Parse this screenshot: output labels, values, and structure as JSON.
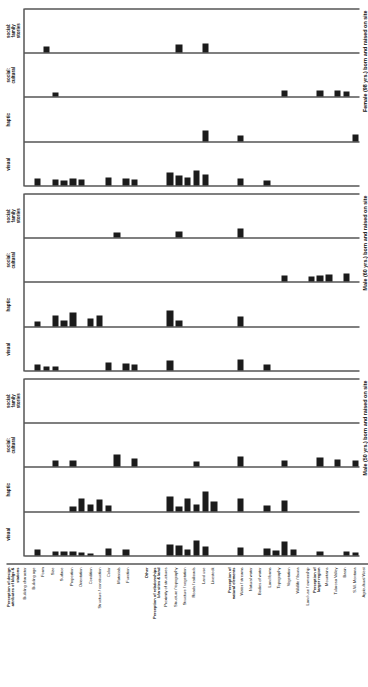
{
  "figure": {
    "orientation": "rotated-90",
    "ink_color": "#1b1b1b",
    "column_headers": [
      "visual",
      "haptic",
      "social:\ncultural",
      "social:\nfamily\nstories"
    ],
    "panel_captions": [
      "Male (50 yrs.) born and raised on site",
      "Male (60 yrs.) born and raised on site",
      "Female (98 yrs.) born and raised on site"
    ],
    "row_labels": [
      "Perception of design\nattributes of bldgs &\nstations",
      "Building character",
      "Building age",
      "Form",
      "Size",
      "Surface",
      "Proportion",
      "Orientation",
      "Condition",
      "Structure / construction",
      "Color",
      "Materials",
      "Function",
      "",
      "Other",
      "Perception of relationships\nb/w sites & land",
      "Proximity of structures",
      "Structure / topography",
      "Structure / vegetation",
      "Roads / railroads",
      "Land use",
      "Livestock",
      "",
      "Perception of\nnatural elements",
      "Water / streams",
      "Natural water",
      "Bodies of water",
      "Land forms",
      "Topography",
      "Vegetation",
      "Wildlife / fauna",
      "Land use / ownership",
      "Perception of\nlarger region",
      "Mountains",
      "Tularosa Valley",
      "Basin",
      "S.W. Montana",
      "Agricultural West"
    ]
  },
  "chart_data": {
    "type": "bar",
    "title": "",
    "xlabel": "",
    "ylabel": "",
    "orientation": "horizontal",
    "xlim": [
      0,
      100
    ],
    "grid": false,
    "legend": "none",
    "categories": [
      "Perception of design attributes of bldgs & stations",
      "Building character",
      "Building age",
      "Form",
      "Size",
      "Surface",
      "Proportion",
      "Orientation",
      "Condition",
      "Structure / construction",
      "Color",
      "Materials",
      "Function",
      "",
      "Other",
      "Perception of relationships b/w sites & land",
      "Proximity of structures",
      "Structure / topography",
      "Structure / vegetation",
      "Roads / railroads",
      "Land use",
      "Livestock",
      "",
      "Perception of natural elements",
      "Water / streams",
      "Natural water",
      "Bodies of water",
      "Land forms",
      "Topography",
      "Vegetation",
      "Wildlife / fauna",
      "Land use / ownership",
      "Perception of larger region",
      "Mountains",
      "Tularosa Valley",
      "Basin",
      "S.W. Montana",
      "Agricultural West"
    ],
    "panels": [
      {
        "name": "Male (50 yrs.) born and raised on site",
        "series": [
          {
            "name": "visual",
            "values": [
              0,
              14,
              0,
              9,
              10,
              9,
              8,
              5,
              0,
              16,
              0,
              13,
              0,
              0,
              0,
              0,
              26,
              22,
              14,
              34,
              20,
              0,
              0,
              0,
              18,
              0,
              0,
              16,
              12,
              32,
              14,
              0,
              0,
              9,
              0,
              0,
              9,
              8
            ]
          },
          {
            "name": "haptic",
            "values": [
              0,
              0,
              0,
              0,
              0,
              12,
              30,
              16,
              28,
              14,
              0,
              0,
              0,
              0,
              0,
              0,
              34,
              12,
              30,
              16,
              46,
              22,
              0,
              0,
              30,
              0,
              0,
              14,
              0,
              26,
              0,
              0,
              0,
              0,
              0,
              0,
              0,
              0
            ]
          },
          {
            "name": "social: cultural",
            "values": [
              0,
              0,
              0,
              16,
              0,
              16,
              0,
              0,
              0,
              0,
              30,
              0,
              20,
              0,
              0,
              0,
              0,
              0,
              0,
              12,
              0,
              0,
              0,
              0,
              24,
              0,
              0,
              0,
              0,
              14,
              0,
              0,
              0,
              22,
              0,
              18,
              0,
              16
            ]
          },
          {
            "name": "social: family stories",
            "values": [
              0,
              0,
              0,
              0,
              0,
              0,
              0,
              0,
              0,
              0,
              0,
              0,
              0,
              0,
              0,
              0,
              0,
              0,
              0,
              0,
              0,
              0,
              0,
              0,
              0,
              0,
              0,
              0,
              0,
              0,
              0,
              0,
              0,
              0,
              0,
              0,
              0,
              0
            ]
          }
        ]
      },
      {
        "name": "Male (60 yrs.) born and raised on site",
        "series": [
          {
            "name": "visual",
            "values": [
              0,
              14,
              9,
              10,
              0,
              0,
              0,
              0,
              0,
              18,
              0,
              16,
              14,
              0,
              0,
              0,
              22,
              0,
              0,
              0,
              0,
              0,
              0,
              0,
              26,
              0,
              0,
              14,
              0,
              0,
              0,
              0,
              0,
              0,
              0,
              0,
              0,
              0
            ]
          },
          {
            "name": "haptic",
            "values": [
              0,
              10,
              0,
              24,
              14,
              32,
              0,
              18,
              26,
              0,
              0,
              0,
              0,
              0,
              0,
              0,
              36,
              14,
              0,
              0,
              0,
              0,
              0,
              0,
              22,
              0,
              0,
              0,
              0,
              0,
              0,
              0,
              0,
              0,
              0,
              0,
              0,
              0
            ]
          },
          {
            "name": "social: cultural",
            "values": [
              0,
              0,
              0,
              0,
              0,
              0,
              0,
              0,
              0,
              0,
              0,
              0,
              0,
              0,
              0,
              0,
              0,
              0,
              0,
              0,
              0,
              0,
              0,
              0,
              0,
              0,
              0,
              0,
              0,
              16,
              0,
              0,
              12,
              16,
              18,
              0,
              20,
              0
            ]
          },
          {
            "name": "social: family stories",
            "values": [
              0,
              0,
              0,
              0,
              0,
              0,
              0,
              0,
              0,
              0,
              12,
              0,
              0,
              0,
              0,
              0,
              0,
              14,
              0,
              0,
              0,
              0,
              0,
              0,
              22,
              0,
              0,
              0,
              0,
              0,
              0,
              0,
              0,
              0,
              0,
              0,
              0,
              0
            ]
          }
        ]
      },
      {
        "name": "Female (98 yrs.) born and raised on site",
        "series": [
          {
            "name": "visual",
            "values": [
              0,
              16,
              0,
              14,
              12,
              16,
              14,
              0,
              0,
              18,
              0,
              16,
              14,
              0,
              0,
              0,
              30,
              22,
              18,
              34,
              26,
              0,
              0,
              0,
              16,
              0,
              0,
              12,
              0,
              0,
              0,
              0,
              0,
              0,
              0,
              0,
              0,
              0
            ]
          },
          {
            "name": "haptic",
            "values": [
              0,
              0,
              0,
              0,
              0,
              0,
              0,
              0,
              0,
              0,
              0,
              0,
              0,
              0,
              0,
              0,
              0,
              0,
              0,
              0,
              26,
              0,
              0,
              0,
              14,
              0,
              0,
              0,
              0,
              0,
              0,
              0,
              0,
              0,
              0,
              0,
              0,
              16
            ]
          },
          {
            "name": "social: cultural",
            "values": [
              0,
              0,
              0,
              10,
              0,
              0,
              0,
              0,
              0,
              0,
              0,
              0,
              0,
              0,
              0,
              0,
              0,
              0,
              0,
              0,
              0,
              0,
              0,
              0,
              0,
              0,
              0,
              0,
              0,
              14,
              0,
              0,
              0,
              16,
              0,
              14,
              12,
              0
            ]
          },
          {
            "name": "social: family stories",
            "values": [
              0,
              0,
              14,
              0,
              0,
              0,
              0,
              0,
              0,
              0,
              0,
              0,
              0,
              0,
              0,
              0,
              0,
              20,
              0,
              0,
              22,
              0,
              0,
              0,
              0,
              0,
              0,
              0,
              0,
              0,
              0,
              0,
              0,
              0,
              0,
              0,
              0,
              0
            ]
          }
        ]
      }
    ]
  }
}
